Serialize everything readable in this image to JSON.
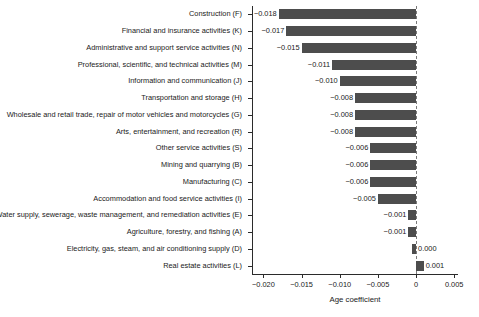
{
  "chart_data": {
    "type": "bar",
    "orientation": "horizontal",
    "title": "",
    "xlabel": "Age coefficient",
    "ylabel": "",
    "xlim": [
      -0.0215,
      0.0055
    ],
    "xticks": [
      -0.02,
      -0.015,
      -0.01,
      -0.005,
      0,
      0.005
    ],
    "xtick_labels": [
      "−0.020",
      "−0.015",
      "−0.010",
      "−0.005",
      "0",
      "0.005"
    ],
    "grid": false,
    "legend": null,
    "reference_line": {
      "x": 0,
      "style": "dashed",
      "color": "#7a7a7a"
    },
    "bar_color": "#4d4d4d",
    "categories": [
      "Construction (F)",
      "Financial and insurance activities (K)",
      "Administrative and support service activities (N)",
      "Professional, scientific, and technical activities (M)",
      "Information and communication (J)",
      "Transportation and storage (H)",
      "Wholesale and retail trade, repair of motor vehicles and motorcycles (G)",
      "Arts, entertainment, and recreation (R)",
      "Other service activities (S)",
      "Mining and quarrying (B)",
      "Manufacturing (C)",
      "Accommodation and food service activities (I)",
      "Water supply, sewerage, waste management, and remediation activities (E)",
      "Agriculture, forestry, and fishing (A)",
      "Electricity, gas, steam, and air conditioning supply (D)",
      "Real estate activities (L)"
    ],
    "values": [
      -0.018,
      -0.017,
      -0.015,
      -0.011,
      -0.01,
      -0.008,
      -0.008,
      -0.008,
      -0.006,
      -0.006,
      -0.006,
      -0.005,
      -0.001,
      -0.001,
      0.0,
      0.001
    ],
    "value_labels": [
      "−0.018",
      "−0.017",
      "−0.015",
      "−0.011",
      "−0.010",
      "−0.008",
      "−0.008",
      "−0.008",
      "−0.006",
      "−0.006",
      "−0.006",
      "−0.005",
      "−0.001",
      "−0.001",
      "0.000",
      "0.001"
    ]
  }
}
